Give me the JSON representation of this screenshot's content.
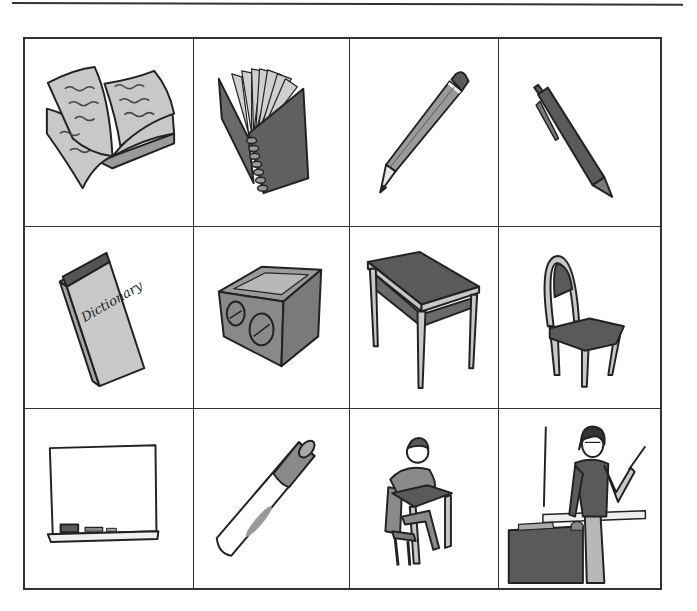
{
  "worksheet": {
    "title": "",
    "cells": [
      {
        "row": 1,
        "col": 1,
        "item": "book",
        "icon": "open-book-icon",
        "label": "book"
      },
      {
        "row": 1,
        "col": 2,
        "item": "notebook",
        "icon": "spiral-notebook-icon",
        "label": "notebook"
      },
      {
        "row": 1,
        "col": 3,
        "item": "pencil",
        "icon": "pencil-icon",
        "label": "pencil"
      },
      {
        "row": 1,
        "col": 4,
        "item": "pen",
        "icon": "pen-icon",
        "label": "pen"
      },
      {
        "row": 2,
        "col": 1,
        "item": "dictionary",
        "icon": "dictionary-icon",
        "label": "dictionary",
        "cover_text": "Dictionary"
      },
      {
        "row": 2,
        "col": 2,
        "item": "pencil sharpener",
        "icon": "sharpener-icon",
        "label": "pencil sharpener"
      },
      {
        "row": 2,
        "col": 3,
        "item": "desk",
        "icon": "desk-icon",
        "label": "desk"
      },
      {
        "row": 2,
        "col": 4,
        "item": "chair",
        "icon": "chair-icon",
        "label": "chair"
      },
      {
        "row": 3,
        "col": 1,
        "item": "board",
        "icon": "whiteboard-icon",
        "label": "board"
      },
      {
        "row": 3,
        "col": 2,
        "item": "marker",
        "icon": "marker-icon",
        "label": "marker"
      },
      {
        "row": 3,
        "col": 3,
        "item": "student",
        "icon": "student-icon",
        "label": "student"
      },
      {
        "row": 3,
        "col": 4,
        "item": "teacher",
        "icon": "teacher-icon",
        "label": "teacher"
      }
    ]
  },
  "colors": {
    "line": "#333333",
    "dark_fill": "#5a5a5a",
    "mid_fill": "#8c8c8c",
    "light_fill": "#c8c8c8",
    "background": "#ffffff"
  }
}
